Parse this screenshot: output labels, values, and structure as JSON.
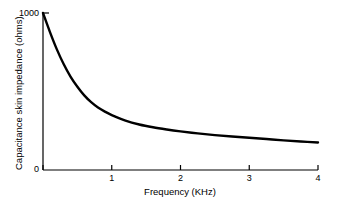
{
  "chart_data": {
    "type": "line",
    "title": "",
    "xlabel": "Frequency (KHz)",
    "ylabel": "Capacitance skin impedance (ohms)",
    "xlim": [
      0,
      4
    ],
    "ylim": [
      0,
      1000
    ],
    "xticks": [
      0,
      1,
      2,
      3,
      4
    ],
    "xtick_labels": [
      "0",
      "1",
      "2",
      "3",
      "4"
    ],
    "yticks": [
      0,
      1000
    ],
    "ytick_labels": [
      "0",
      "1000"
    ],
    "grid": false,
    "legend": "none",
    "series": [
      {
        "name": "Capacitance skin impedance",
        "color": "#000000",
        "x": [
          0.0,
          0.1,
          0.2,
          0.3,
          0.4,
          0.5,
          0.6,
          0.7,
          0.8,
          0.9,
          1.0,
          1.2,
          1.4,
          1.6,
          1.8,
          2.0,
          2.25,
          2.5,
          2.75,
          3.0,
          3.25,
          3.5,
          3.75,
          4.0
        ],
        "y": [
          1000,
          880,
          770,
          675,
          595,
          530,
          475,
          432,
          398,
          372,
          350,
          315,
          290,
          272,
          258,
          246,
          233,
          222,
          213,
          205,
          197,
          189,
          182,
          175
        ]
      }
    ]
  },
  "axes": {
    "x_label": "Frequency (KHz)",
    "y_label": "Capacitance skin impedance (ohms)",
    "x_tick_0": "0",
    "x_tick_1": "1",
    "x_tick_2": "2",
    "x_tick_3": "3",
    "x_tick_4": "4",
    "y_tick_top": "1000",
    "y_tick_bottom": "0"
  },
  "style": {
    "curve_color": "#000000",
    "axis_color": "#000000",
    "background": "#ffffff"
  }
}
